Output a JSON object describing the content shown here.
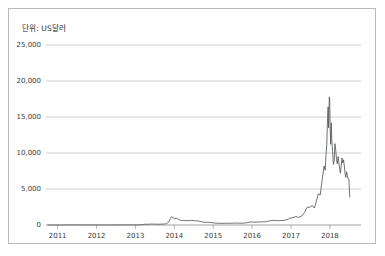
{
  "card": {
    "unit_label": "단위: US달러",
    "border_color": "#b9b9b9",
    "background": "#ffffff"
  },
  "chart_data": {
    "type": "line",
    "title": "",
    "subtitle": "",
    "xlabel": "",
    "ylabel": "단위: US달러",
    "grid": true,
    "legend": null,
    "line_color": "#55585c",
    "grid_color": "#bfbfbf",
    "axis_color": "#8a8a8a",
    "ylim": [
      0,
      25000
    ],
    "yticks": [
      0,
      5000,
      10000,
      15000,
      20000,
      25000
    ],
    "ytick_labels": [
      "0",
      "5,000",
      "10,000",
      "15,000",
      "20,000",
      "25,000"
    ],
    "xlim": [
      2010.7,
      2018.8
    ],
    "xticks": [
      2011,
      2012,
      2013,
      2014,
      2015,
      2016,
      2017,
      2018
    ],
    "xtick_labels": [
      "2011",
      "2012",
      "2013",
      "2014",
      "2015",
      "2016",
      "2017",
      "2018"
    ],
    "series": [
      {
        "name": "Bitcoin price",
        "x": [
          2010.75,
          2010.9,
          2011.05,
          2011.2,
          2011.35,
          2011.5,
          2011.62,
          2011.75,
          2011.9,
          2012.05,
          2012.2,
          2012.35,
          2012.5,
          2012.65,
          2012.8,
          2012.95,
          2013.05,
          2013.15,
          2013.25,
          2013.32,
          2013.4,
          2013.5,
          2013.6,
          2013.68,
          2013.75,
          2013.8,
          2013.85,
          2013.9,
          2013.93,
          2013.96,
          2014.0,
          2014.05,
          2014.1,
          2014.15,
          2014.2,
          2014.25,
          2014.3,
          2014.38,
          2014.45,
          2014.52,
          2014.6,
          2014.68,
          2014.75,
          2014.82,
          2014.9,
          2014.97,
          2015.05,
          2015.15,
          2015.25,
          2015.35,
          2015.45,
          2015.55,
          2015.65,
          2015.75,
          2015.85,
          2015.95,
          2016.05,
          2016.15,
          2016.25,
          2016.35,
          2016.45,
          2016.55,
          2016.62,
          2016.7,
          2016.8,
          2016.9,
          2016.97,
          2017.05,
          2017.12,
          2017.2,
          2017.28,
          2017.35,
          2017.42,
          2017.48,
          2017.55,
          2017.6,
          2017.65,
          2017.7,
          2017.75,
          2017.8,
          2017.85,
          2017.88,
          2017.9,
          2017.92,
          2017.94,
          2017.955,
          2017.965,
          2017.975,
          2017.985,
          2017.995,
          2018.005,
          2018.02,
          2018.035,
          2018.05,
          2018.07,
          2018.09,
          2018.11,
          2018.13,
          2018.15,
          2018.17,
          2018.19,
          2018.21,
          2018.23,
          2018.25,
          2018.27,
          2018.29,
          2018.31,
          2018.33,
          2018.35,
          2018.37,
          2018.39,
          2018.41,
          2018.43,
          2018.45,
          2018.47,
          2018.49,
          2018.51
        ],
        "values": [
          0,
          1,
          1,
          10,
          18,
          14,
          8,
          4,
          3,
          5,
          5,
          6,
          8,
          11,
          12,
          13,
          20,
          35,
          110,
          95,
          130,
          115,
          105,
          125,
          135,
          190,
          380,
          900,
          1150,
          1050,
          870,
          920,
          830,
          660,
          610,
          650,
          580,
          620,
          640,
          590,
          570,
          480,
          390,
          380,
          360,
          320,
          260,
          240,
          230,
          250,
          235,
          270,
          250,
          240,
          300,
          420,
          400,
          420,
          430,
          455,
          580,
          650,
          620,
          600,
          640,
          730,
          960,
          1010,
          1180,
          1060,
          1250,
          1750,
          2500,
          2450,
          2700,
          2350,
          3250,
          4350,
          4150,
          6200,
          8200,
          7600,
          9700,
          11200,
          14800,
          16400,
          13500,
          15200,
          17800,
          17400,
          13800,
          11200,
          14200,
          11600,
          10200,
          8400,
          8900,
          11300,
          10400,
          9100,
          8500,
          9500,
          8700,
          7900,
          7200,
          8200,
          9300,
          8600,
          9050,
          8300,
          7100,
          6600,
          7400,
          6900,
          6400,
          6350,
          3900
        ]
      }
    ],
    "annotations": [
      {
        "label": "peak",
        "x": 2017.985,
        "y": 17800
      }
    ]
  }
}
